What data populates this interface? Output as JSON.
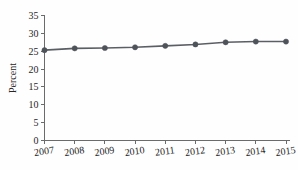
{
  "chart_data": {
    "type": "line",
    "title": "",
    "subtitle": "",
    "xlabel": "",
    "ylabel": "Percent",
    "categories": [
      "2007",
      "2008",
      "2009",
      "2010",
      "2011",
      "2012",
      "2013",
      "2014",
      "2015"
    ],
    "x": [
      2007,
      2008,
      2009,
      2010,
      2011,
      2012,
      2013,
      2014,
      2015
    ],
    "values": [
      25.3,
      25.8,
      25.9,
      26.1,
      26.5,
      26.9,
      27.5,
      27.7,
      27.7
    ],
    "series": [
      {
        "name": "Percent",
        "values": [
          25.3,
          25.8,
          25.9,
          26.1,
          26.5,
          26.9,
          27.5,
          27.7,
          27.7
        ]
      }
    ],
    "ylim": [
      0,
      35
    ],
    "yticks": [
      0,
      5,
      10,
      15,
      20,
      25,
      30,
      35
    ],
    "ytick_labels": [
      "0",
      "5",
      "10",
      "15",
      "20",
      "25",
      "30",
      "35"
    ],
    "xtick_labels": [
      "2007",
      "2008",
      "2009",
      "2010",
      "2011",
      "2012",
      "2013",
      "2014",
      "2015"
    ],
    "grid": false,
    "legend": false,
    "legend_position": "none",
    "marker": "circle",
    "line_color": "#5a5f66",
    "marker_color": "#4e535a",
    "background_color": "#fefefe",
    "axis_color": "#6b6b6b",
    "tick_direction": "out"
  }
}
